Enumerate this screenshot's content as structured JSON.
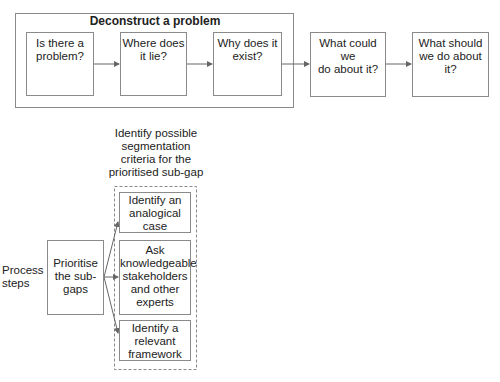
{
  "top_group": {
    "title": "Deconstruct a problem",
    "steps": [
      {
        "label_1": "Is there a",
        "label_2": "problem?",
        "icon": "people-question-icon"
      },
      {
        "label_1": "Where does",
        "label_2": "it lie?",
        "icon": "map-icon"
      },
      {
        "label_1": "Why does it",
        "label_2": "exist?",
        "icon": "flow-path-icon"
      }
    ]
  },
  "next_steps": [
    {
      "label_1": "What could we",
      "label_2": "do about it?",
      "icon": "signpost-icon"
    },
    {
      "label_1": "What should",
      "label_2": "we do about it?",
      "icon": "presenter-board-icon"
    }
  ],
  "bottom": {
    "row_label_1": "Process",
    "row_label_2": "steps",
    "prioritise_1": "Prioritise",
    "prioritise_2": "the sub-",
    "prioritise_3": "gaps",
    "group_caption_1": "Identify possible",
    "group_caption_2": "segmentation",
    "group_caption_3": "criteria for the",
    "group_caption_4": "prioritised sub-gap",
    "options": [
      {
        "l1": "Identify an",
        "l2": "analogical",
        "l3": "case"
      },
      {
        "l1": "Ask",
        "l2": "knowledgeable",
        "l3": "stakeholders",
        "l4": "and other",
        "l5": "experts"
      },
      {
        "l1": "Identify a",
        "l2": "relevant",
        "l3": "framework"
      }
    ]
  },
  "colors": {
    "border": "#8a8a8a",
    "text": "#222222",
    "arrow": "#666666"
  }
}
